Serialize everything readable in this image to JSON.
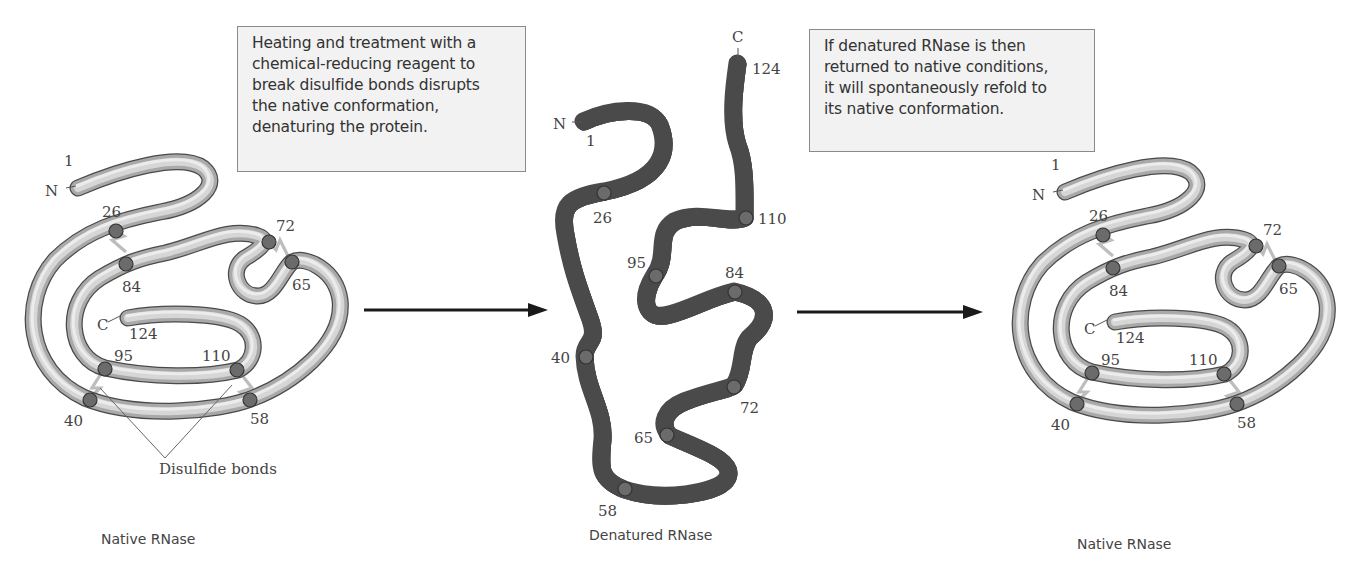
{
  "figure": {
    "notes": {
      "left": {
        "lines": [
          "Heating and treatment with a",
          "chemical-reducing reagent to",
          "break disulfide bonds disrupts",
          "the native conformation,",
          "denaturing the protein."
        ]
      },
      "right": {
        "lines": [
          "If denatured RNase is then",
          "returned to native conditions,",
          "it will spontaneously refold to",
          "its native conformation."
        ]
      }
    },
    "panels": {
      "native_left": {
        "caption": "Native RNase",
        "terminus_n": "N",
        "terminus_c": "C",
        "residues": [
          "1",
          "26",
          "84",
          "72",
          "65",
          "124",
          "95",
          "110",
          "40",
          "58"
        ],
        "callout": "Disulfide bonds"
      },
      "denatured": {
        "caption": "Denatured RNase",
        "terminus_n": "N",
        "terminus_c": "C",
        "residues": [
          "1",
          "26",
          "124",
          "110",
          "95",
          "84",
          "40",
          "72",
          "65",
          "58"
        ]
      },
      "native_right": {
        "caption": "Native RNase",
        "terminus_n": "N",
        "terminus_c": "C",
        "residues": [
          "1",
          "26",
          "84",
          "72",
          "65",
          "124",
          "95",
          "110",
          "40",
          "58"
        ]
      }
    },
    "disulfide_pairs": [
      [
        "26",
        "84"
      ],
      [
        "40",
        "95"
      ],
      [
        "58",
        "110"
      ],
      [
        "65",
        "72"
      ]
    ],
    "arrows": [
      "denaturation-arrow",
      "renaturation-arrow"
    ],
    "colors": {
      "tube_outline": "#4a4a4a",
      "tube_fill": "#d6d6d6",
      "cysteine": "#6b6b6b",
      "disulfide": "#bdbdbd",
      "note_bg": "#f2f2f2"
    }
  }
}
